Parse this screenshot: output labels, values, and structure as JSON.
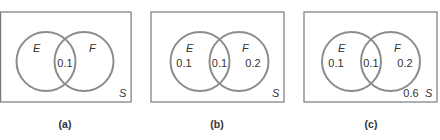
{
  "figure": {
    "colors": {
      "circle_stroke": "#8c8c8c",
      "rect_stroke": "#7a7a7a",
      "text": "#333333"
    },
    "panels": [
      {
        "id": "a",
        "caption": "(a)",
        "universe_label": "S",
        "set_e_label": "E",
        "set_f_label": "F",
        "e_only": "",
        "intersection": "0.1",
        "f_only": "",
        "outside": ""
      },
      {
        "id": "b",
        "caption": "(b)",
        "universe_label": "S",
        "set_e_label": "E",
        "set_f_label": "F",
        "e_only": "0.1",
        "intersection": "0.1",
        "f_only": "0.2",
        "outside": ""
      },
      {
        "id": "c",
        "caption": "(c)",
        "universe_label": "S",
        "set_e_label": "E",
        "set_f_label": "F",
        "e_only": "0.1",
        "intersection": "0.1",
        "f_only": "0.2",
        "outside": "0.6"
      }
    ]
  }
}
